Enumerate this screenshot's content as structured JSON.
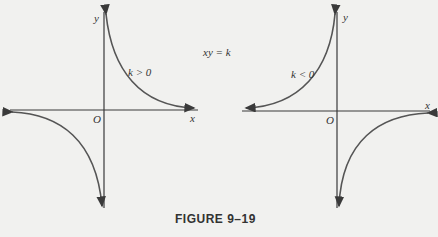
{
  "figure": {
    "caption": "FIGURE 9–19",
    "equation": "xy = k",
    "left_graph": {
      "condition": "k > 0",
      "x_axis_label": "x",
      "y_axis_label": "y",
      "origin_label": "O",
      "branches": [
        "quadrant I",
        "quadrant III"
      ]
    },
    "right_graph": {
      "condition": "k < 0",
      "x_axis_label": "x",
      "y_axis_label": "y",
      "origin_label": "O",
      "branches": [
        "quadrant II",
        "quadrant IV"
      ]
    },
    "colors": {
      "axis": "#3a3a3a",
      "curve": "#555555",
      "background": "#f1f1ef"
    }
  }
}
